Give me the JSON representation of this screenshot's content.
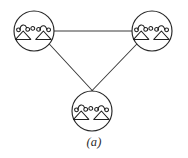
{
  "figure": {
    "caption": "(a)",
    "background_color": "#ffffff",
    "line_color": "#3a3a3a",
    "node_outline_color": "#262626",
    "symbol_color": "#1f1f1f",
    "width": 188,
    "height": 158
  },
  "chart_data": {
    "type": "diagram",
    "title": "(a)",
    "subtitle": "",
    "layout": "triangle",
    "grid": false,
    "legend_position": "none",
    "nodes": [
      {
        "id": "node-top-left",
        "label": "",
        "symbol": "delta-delta-transformer",
        "cx": 34,
        "cy": 31,
        "r": 20
      },
      {
        "id": "node-top-right",
        "label": "",
        "symbol": "delta-delta-transformer",
        "cx": 152,
        "cy": 31,
        "r": 20
      },
      {
        "id": "node-bottom",
        "label": "",
        "symbol": "delta-delta-transformer",
        "cx": 92,
        "cy": 111,
        "r": 20
      }
    ],
    "edges": [
      {
        "id": "edge-top",
        "from": "node-top-left",
        "to": "node-top-right",
        "x1": 50,
        "y1": 31,
        "x2": 136,
        "y2": 31
      },
      {
        "id": "edge-left",
        "from": "node-top-left",
        "to": "node-bottom",
        "x1": 29,
        "y1": 22,
        "x2": 101,
        "y2": 100
      },
      {
        "id": "edge-right",
        "from": "node-top-right",
        "to": "node-bottom",
        "x1": 158,
        "y1": 22,
        "x2": 83,
        "y2": 100
      }
    ]
  }
}
